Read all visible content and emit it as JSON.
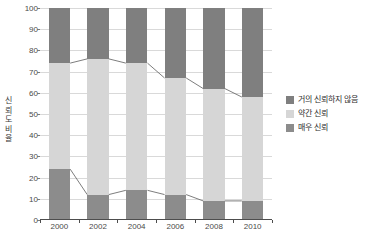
{
  "chart_data": {
    "type": "bar",
    "variant": "stacked-100-percent",
    "title": "",
    "subtitle": "",
    "xlabel": "",
    "ylabel": "신뢰도 비율",
    "categories": [
      "2000",
      "2002",
      "2004",
      "2006",
      "2008",
      "2010"
    ],
    "ylim": [
      0,
      100
    ],
    "ytick_values": [
      0,
      10,
      20,
      30,
      40,
      50,
      60,
      70,
      80,
      90,
      100
    ],
    "ytick_labels": [
      "0",
      "10",
      "20",
      "30",
      "40",
      "50",
      "60",
      "70",
      "80",
      "90",
      "100"
    ],
    "grid": true,
    "grid_axis": "y",
    "legend_position": "right",
    "series": [
      {
        "name": "매우 신뢰",
        "stack_order": 0,
        "color": "#8c8c8c",
        "values": [
          24,
          12,
          14,
          12,
          9,
          9
        ]
      },
      {
        "name": "약간 신뢰",
        "stack_order": 1,
        "color": "#d6d6d6",
        "values": [
          50,
          64,
          60,
          55,
          53,
          49
        ]
      },
      {
        "name": "거의 신뢰하지 않음",
        "stack_order": 2,
        "color": "#7f7f7f",
        "values": [
          26,
          24,
          26,
          33,
          38,
          42
        ]
      }
    ],
    "cumulative_boundaries": {
      "lower": [
        24,
        12,
        14,
        12,
        9,
        9
      ],
      "upper": [
        74,
        76,
        74,
        67,
        62,
        58
      ]
    },
    "connector_lines": true
  },
  "legend": {
    "items": [
      {
        "label": "거의 신뢰하지 않음",
        "color": "#7f7f7f"
      },
      {
        "label": "약간 신뢰",
        "color": "#d6d6d6"
      },
      {
        "label": "매우 신뢰",
        "color": "#8c8c8c"
      }
    ]
  },
  "y_axis_title_chars": [
    "신",
    "뢰",
    "도",
    "비",
    "율"
  ],
  "colors": {
    "series_dark_top": "#7f7f7f",
    "series_light_middle": "#d6d6d6",
    "series_dark_bottom": "#8c8c8c",
    "gridline": "#d9d9d9",
    "axis": "#4d4d4d",
    "text": "#4a4a4a",
    "background": "#ffffff"
  }
}
